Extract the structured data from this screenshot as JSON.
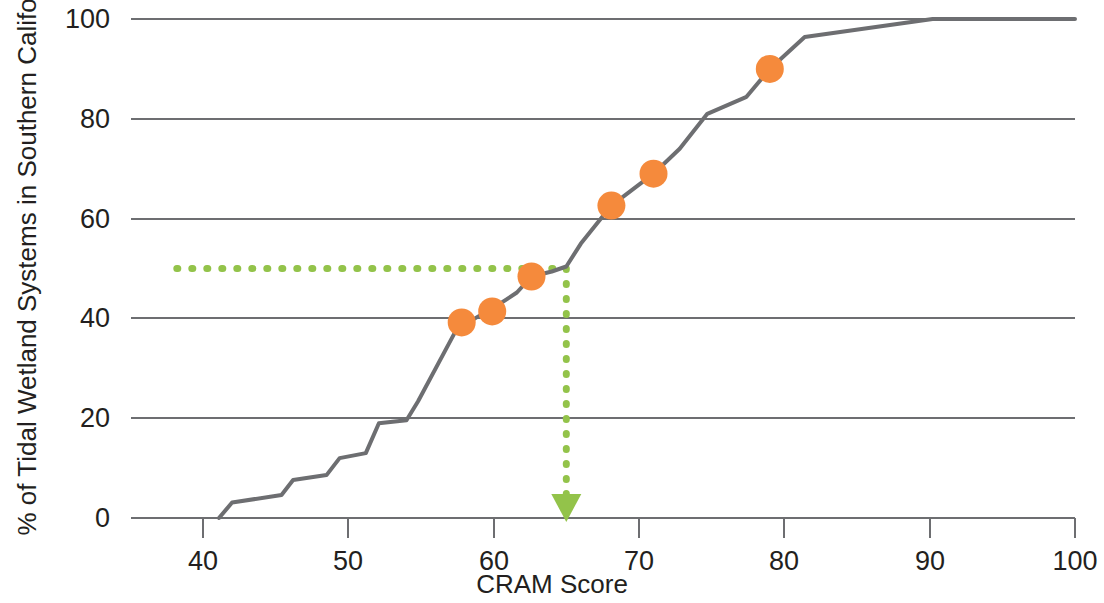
{
  "chart_data": {
    "type": "line",
    "title": "",
    "xlabel": "CRAM Score",
    "ylabel": "% of Tidal Wetland Systems in Southern California",
    "xlim": [
      35,
      102
    ],
    "ylim": [
      0,
      100
    ],
    "xticks": [
      40,
      50,
      60,
      70,
      80,
      90,
      100
    ],
    "xtick_labels": [
      "40",
      "50",
      "60",
      "70",
      "80",
      "90",
      "100"
    ],
    "yticks": [
      0,
      20,
      40,
      60,
      80,
      100
    ],
    "ytick_labels": [
      "0",
      "20",
      "40",
      "60",
      "80",
      "100"
    ],
    "grid": "horizontal",
    "legend": "none",
    "colors": {
      "curve": "#6d6e71",
      "gridline": "#6d6e71",
      "points": "#f58a3c",
      "reference": "#93c34a",
      "text": "#231f20",
      "background": "#ffffff"
    },
    "series": [
      {
        "name": "Cumulative distribution of CRAM scores",
        "type": "line",
        "color": "#6d6e71",
        "points": [
          [
            41.1,
            0.0
          ],
          [
            42.0,
            3.1
          ],
          [
            45.4,
            4.6
          ],
          [
            46.2,
            7.6
          ],
          [
            48.5,
            8.6
          ],
          [
            49.4,
            12.0
          ],
          [
            51.2,
            13.0
          ],
          [
            52.1,
            19.0
          ],
          [
            54.0,
            19.6
          ],
          [
            54.8,
            23.4
          ],
          [
            57.3,
            37.0
          ],
          [
            58.6,
            39.8
          ],
          [
            59.3,
            41.0
          ],
          [
            60.2,
            42.5
          ],
          [
            61.6,
            45.2
          ],
          [
            62.6,
            48.4
          ],
          [
            64.0,
            49.4
          ],
          [
            65.0,
            50.4
          ],
          [
            66.0,
            55.0
          ],
          [
            68.1,
            62.6
          ],
          [
            71.0,
            69.0
          ],
          [
            72.8,
            74.0
          ],
          [
            74.7,
            81.0
          ],
          [
            77.4,
            84.4
          ],
          [
            79.0,
            90.0
          ],
          [
            81.4,
            96.4
          ],
          [
            90.2,
            100.0
          ],
          [
            100.0,
            100.0
          ]
        ]
      },
      {
        "name": "Highlighted wetland systems",
        "type": "scatter",
        "color": "#f58a3c",
        "marker_radius_px": 14,
        "points": [
          [
            57.8,
            39.2
          ],
          [
            59.9,
            41.4
          ],
          [
            62.6,
            48.4
          ],
          [
            68.1,
            62.6
          ],
          [
            71.0,
            69.0
          ],
          [
            79.0,
            90.0
          ]
        ]
      }
    ],
    "annotations": [
      {
        "name": "median-reference-horizontal",
        "type": "dotted-line",
        "orientation": "horizontal",
        "value": 50,
        "x_from": 38.2,
        "x_to": 65.0,
        "color": "#93c34a"
      },
      {
        "name": "median-reference-vertical-arrow",
        "type": "dotted-arrow",
        "orientation": "vertical",
        "value": 65,
        "y_from": 50,
        "y_to": 3.6,
        "color": "#93c34a"
      }
    ]
  },
  "axes": {
    "y_title": "% of Tidal Wetland Systems in Southern California",
    "x_title": "CRAM Score",
    "y_tick_labels": [
      "100",
      "80",
      "60",
      "40",
      "20",
      "0"
    ],
    "x_tick_labels": [
      "40",
      "50",
      "60",
      "70",
      "80",
      "90",
      "100"
    ]
  }
}
